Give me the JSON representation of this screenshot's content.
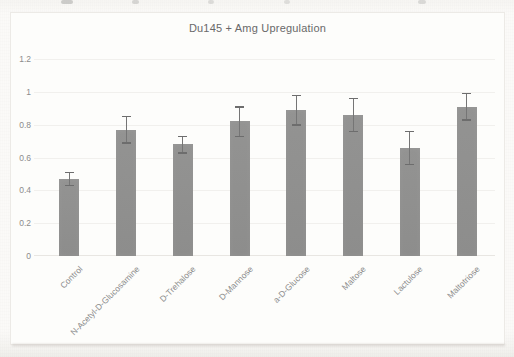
{
  "chart_data": {
    "type": "bar",
    "title": "Du145 + Amg Upregulation",
    "categories": [
      "Control",
      "N-Acetyl-D-Glucosamine",
      "D-Trehalose",
      "D-Mannose",
      "a-D-Glucose",
      "Maltose",
      "Lactulose",
      "Maltotriose"
    ],
    "values": [
      0.47,
      0.77,
      0.68,
      0.82,
      0.89,
      0.86,
      0.66,
      0.91
    ],
    "errors": [
      0.04,
      0.08,
      0.05,
      0.09,
      0.09,
      0.1,
      0.1,
      0.08
    ],
    "xlabel": "",
    "ylabel": "",
    "ylim": [
      0,
      1.2
    ],
    "yticks": [
      0,
      0.2,
      0.4,
      0.6,
      0.8,
      1.0,
      1.2
    ],
    "ytick_labels": [
      "0",
      "0.2",
      "0.4",
      "0.6",
      "0.8",
      "1",
      "1.2"
    ],
    "grid": true,
    "legend": "none"
  },
  "colors": {
    "page_background": "#faf9f7",
    "chart_background": "#fdfdfb",
    "chart_border": "#eceae6",
    "bar_fill": "#8f8f8f",
    "error_bar": "#6d6d6d",
    "title_text": "#696969",
    "tick_text": "#8c8c8c",
    "gridline": "#f1f0ed"
  }
}
